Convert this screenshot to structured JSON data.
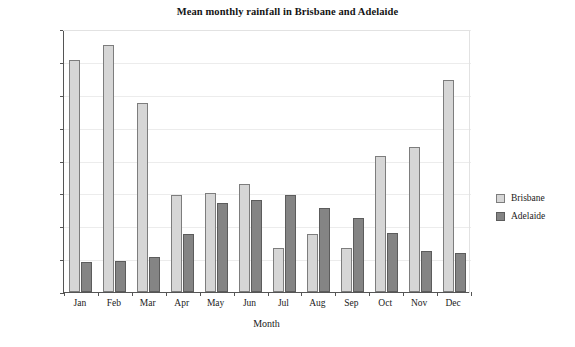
{
  "chart_data": {
    "type": "bar",
    "title": "Mean monthly rainfall in Brisbane and Adelaide",
    "xlabel": "Month",
    "ylabel": "Rainfall (mm)",
    "categories": [
      "Jan",
      "Feb",
      "Mar",
      "Apr",
      "May",
      "Jun",
      "Jul",
      "Aug",
      "Sep",
      "Oct",
      "Nov",
      "Dec"
    ],
    "series": [
      {
        "name": "Brisbane",
        "color": "#d6d6d6",
        "values": [
          141,
          150,
          115,
          59,
          60,
          66,
          27,
          35,
          27,
          83,
          88,
          129
        ]
      },
      {
        "name": "Adelaide",
        "color": "#848484",
        "values": [
          18,
          19,
          21,
          35,
          54,
          56,
          59,
          51,
          45,
          36,
          25,
          24
        ]
      }
    ],
    "ylim": [
      0,
      160
    ],
    "yticks": [
      0,
      20,
      40,
      60,
      80,
      100,
      120,
      140,
      160
    ],
    "grid": true,
    "legend_position": "right"
  }
}
